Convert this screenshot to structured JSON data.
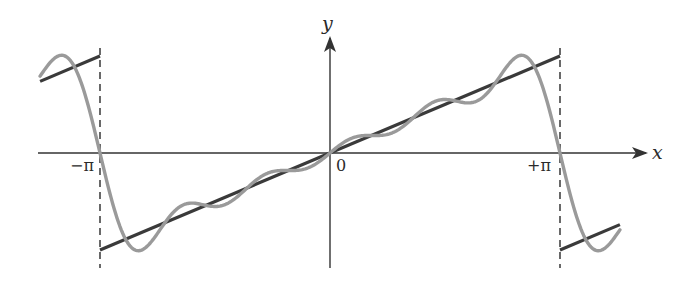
{
  "chart_data": {
    "type": "line",
    "title": "",
    "xlabel": "x",
    "ylabel": "y",
    "x_ticks": [
      {
        "value": -3.14159,
        "label": "−π"
      },
      {
        "value": 0,
        "label": "0"
      },
      {
        "value": 3.14159,
        "label": "+π"
      }
    ],
    "xlim": [
      -4.0,
      4.35
    ],
    "ylim": [
      -3.8,
      4.0
    ],
    "grid": false,
    "legend": null,
    "series": [
      {
        "name": "sawtooth f(x) = x (periodic, period 2π)",
        "style": "solid dark line",
        "color": "#3a3a3a",
        "segments": [
          {
            "x": [
              -3.96,
              -3.14159
            ],
            "y": [
              2.32,
              3.14159
            ]
          },
          {
            "x": [
              -3.14159,
              3.14159
            ],
            "y": [
              -3.14159,
              3.14159
            ]
          },
          {
            "x": [
              3.14159,
              3.96
            ],
            "y": [
              -3.14159,
              -2.32
            ]
          }
        ]
      },
      {
        "name": "Fourier partial sum (N=5)",
        "style": "solid gray line",
        "color": "#9a9a9a",
        "formula": "2*sum_{n=1..5} (-1)^(n+1) sin(n x)/n",
        "terms": 5,
        "x_range": [
          -3.96,
          3.96
        ],
        "x": [
          -3.6,
          -3.14159,
          -2.62,
          -1.57,
          0,
          1.57,
          2.62,
          3.14159,
          3.6
        ],
        "y": [
          2.6,
          0,
          -3.7,
          -1.37,
          0,
          1.37,
          3.7,
          0,
          -2.6
        ]
      }
    ],
    "annotations": [
      {
        "type": "dashed-vertical",
        "x": -3.14159,
        "y_range": [
          -3.8,
          3.4
        ]
      },
      {
        "type": "dashed-vertical",
        "x": 3.14159,
        "y_range": [
          -3.8,
          3.4
        ]
      }
    ]
  },
  "labels": {
    "x_axis": "x",
    "y_axis": "y",
    "origin": "0",
    "neg_pi": "−π",
    "pos_pi": "+π"
  },
  "colors": {
    "axis": "#333333",
    "sawtooth": "#3a3a3a",
    "fourier": "#9a9a9a"
  }
}
